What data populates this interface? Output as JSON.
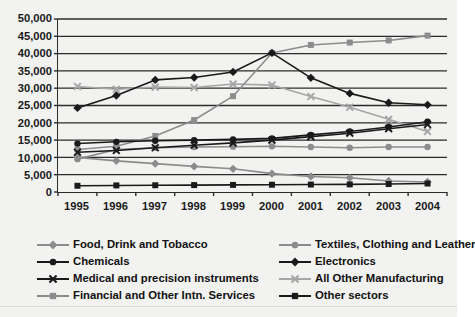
{
  "chart_data": {
    "type": "line",
    "title": "",
    "xlabel": "",
    "ylabel": "",
    "categories": [
      "1995",
      "1996",
      "1997",
      "1998",
      "1999",
      "2000",
      "2001",
      "2002",
      "2003",
      "2004"
    ],
    "x": [
      1995,
      1996,
      1997,
      1998,
      1999,
      2000,
      2001,
      2002,
      2003,
      2004
    ],
    "ylim": [
      0,
      50000
    ],
    "ytick_labels": [
      "0",
      "5,000",
      "10,000",
      "15,000",
      "20,000",
      "25,000",
      "30,000",
      "35,000",
      "40,000",
      "45,000",
      "50,000"
    ],
    "ytick_values": [
      0,
      5000,
      10000,
      15000,
      20000,
      25000,
      30000,
      35000,
      40000,
      45000,
      50000
    ],
    "grid": true,
    "grid_axis": "y",
    "legend_position": "bottom",
    "legend_columns": 2,
    "series": [
      {
        "name": "Food, Drink and Tobacco",
        "color": "#8c8c8c",
        "marker": "diamond",
        "values": [
          10000,
          9000,
          8200,
          7400,
          6700,
          5300,
          4500,
          4100,
          3200,
          2900
        ]
      },
      {
        "name": "Chemicals",
        "color": "#1a1a1a",
        "marker": "circle",
        "values": [
          14000,
          14500,
          14800,
          15000,
          15200,
          15500,
          16500,
          17500,
          18800,
          20300
        ]
      },
      {
        "name": "Medical and precision instruments",
        "color": "#1a1a1a",
        "marker": "x",
        "values": [
          11500,
          12000,
          12800,
          13500,
          14200,
          15000,
          16000,
          17000,
          18300,
          19500
        ]
      },
      {
        "name": "Financial and Other Intn. Services",
        "color": "#8c8c8c",
        "marker": "square",
        "values": [
          12300,
          13200,
          16200,
          20800,
          27700,
          40200,
          42500,
          43200,
          43800,
          45200
        ]
      },
      {
        "name": "Textiles, Clothing and Leather",
        "color": "#8c8c8c",
        "marker": "circle",
        "values": [
          9500,
          12300,
          12800,
          13000,
          13100,
          13200,
          13000,
          12800,
          13000,
          13000
        ]
      },
      {
        "name": "Electronics",
        "color": "#1a1a1a",
        "marker": "diamond",
        "values": [
          24300,
          27900,
          32400,
          33100,
          34700,
          40200,
          33000,
          28500,
          25800,
          25200
        ]
      },
      {
        "name": "All Other Manufacturing",
        "color": "#a6a6a6",
        "marker": "x",
        "values": [
          30500,
          29700,
          30300,
          30200,
          31200,
          30900,
          27600,
          24500,
          21000,
          17500
        ]
      },
      {
        "name": "Other sectors",
        "color": "#1a1a1a",
        "marker": "square",
        "values": [
          1800,
          1900,
          1950,
          2000,
          2050,
          2100,
          2150,
          2200,
          2300,
          2450
        ]
      }
    ]
  },
  "legend": {
    "left_column": [
      "Food, Drink and Tobacco",
      "Chemicals",
      "Medical and precision instruments",
      "Financial and Other Intn. Services"
    ],
    "right_column": [
      "Textiles, Clothing and Leather",
      "Electronics",
      "All Other Manufacturing",
      "Other sectors"
    ]
  },
  "colors": {
    "background": "#f2f2f0",
    "axis": "#2b2b2b",
    "gridline": "#2b2b2b",
    "dark_series": "#1a1a1a",
    "gray_series": "#8c8c8c",
    "light_gray_series": "#a6a6a6",
    "text": "#111111"
  }
}
